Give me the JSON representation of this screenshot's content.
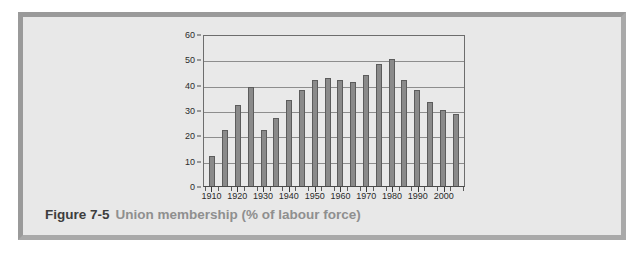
{
  "caption": {
    "figure_number": "Figure 7-5",
    "title": "Union membership (% of labour force)"
  },
  "colors": {
    "bar_fill": "#8a8a8a",
    "bar_stroke": "#5c5c5c",
    "panel_background": "#e8e8e8",
    "frame_border": "#9a9a9a",
    "gridline": "#8d8d8d",
    "axis_text": "#2b2b2b",
    "caption_figure": "#3d3d3d",
    "caption_title": "#8f8f8f"
  },
  "chart_data": {
    "type": "bar",
    "title": "Union membership (% of labour force)",
    "xlabel": "",
    "ylabel": "",
    "ylim": [
      0,
      60
    ],
    "yticks": [
      0,
      10,
      20,
      30,
      40,
      50,
      60
    ],
    "ytick_labels": [
      "0",
      "10",
      "20",
      "30",
      "40",
      "50",
      "60"
    ],
    "xlim": [
      1908,
      2008
    ],
    "xtick_labels": [
      "1910",
      "1920",
      "1930",
      "1940",
      "1950",
      "1960",
      "1970",
      "1980",
      "1990",
      "2000"
    ],
    "xticks": [
      1910,
      1920,
      1930,
      1940,
      1950,
      1960,
      1970,
      1980,
      1990,
      2000
    ],
    "grid": true,
    "legend": false,
    "categories": [
      1911,
      1916,
      1921,
      1926,
      1931,
      1936,
      1941,
      1946,
      1951,
      1956,
      1961,
      1966,
      1971,
      1976,
      1981,
      1986,
      1991,
      1996,
      2001,
      2006
    ],
    "values": [
      12,
      22,
      32,
      39,
      22,
      27,
      34,
      38,
      42,
      42.5,
      42,
      41,
      44,
      48,
      50,
      42,
      38,
      33,
      30,
      28.5
    ],
    "bar_count": 20
  }
}
